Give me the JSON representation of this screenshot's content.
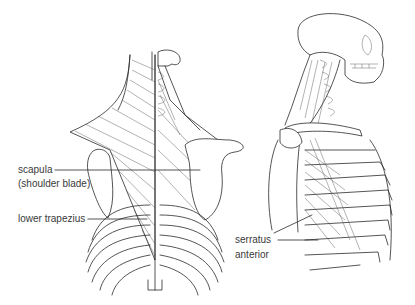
{
  "diagram": {
    "title": "",
    "views": [
      {
        "name": "posterior view",
        "description": "back of torso showing trapezius, scapula and ribs"
      },
      {
        "name": "lateral view",
        "description": "side view of skull, neck and rib cage showing serratus anterior"
      }
    ],
    "labels": {
      "scapula": "scapula",
      "scapula_note": "(shoulder blade)",
      "lower_trapezius": "lower trapezius",
      "serratus_1": "serratus",
      "serratus_2": "anterior"
    },
    "colors": {
      "line": "#2a2a2a",
      "text": "#3a3a3a",
      "background": "#ffffff"
    }
  }
}
